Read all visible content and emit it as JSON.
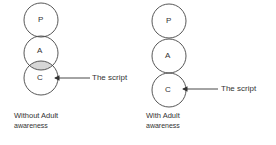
{
  "diagrams": [
    {
      "id": "without",
      "circles": [
        {
          "label": "P",
          "cx": 41,
          "cy": 20,
          "r": 17
        },
        {
          "label": "A",
          "cx": 41,
          "cy": 53,
          "r": 17
        },
        {
          "label": "C",
          "cx": 41,
          "cy": 78,
          "r": 17
        }
      ],
      "overlap_fill": "#d6d6d6",
      "pointer_label": "The script",
      "caption_line1": "Without Adult",
      "caption_line2": "awareness"
    },
    {
      "id": "with",
      "circles": [
        {
          "label": "P",
          "cx": 169,
          "cy": 21,
          "r": 17
        },
        {
          "label": "A",
          "cx": 169,
          "cy": 56,
          "r": 17
        },
        {
          "label": "C",
          "cx": 169,
          "cy": 90,
          "r": 17
        }
      ],
      "pointer_label": "The script",
      "caption_line1": "With Adult",
      "caption_line2": "awareness"
    }
  ],
  "colors": {
    "stroke": "#333333",
    "overlap": "#d6d6d6"
  }
}
